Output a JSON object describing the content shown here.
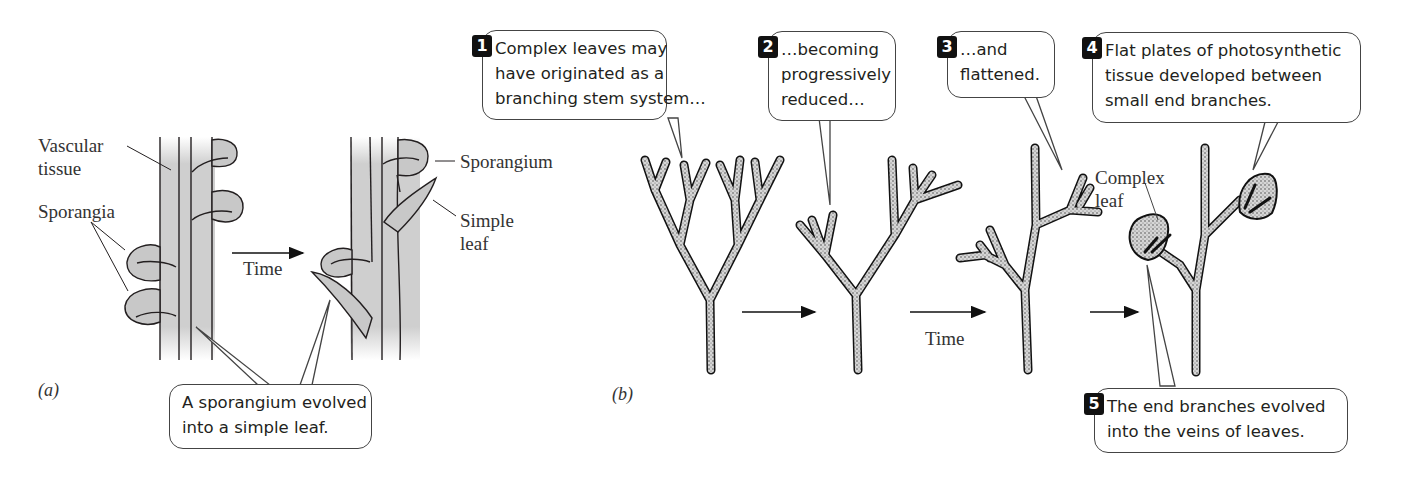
{
  "panel_a": {
    "panel_label": "(a)",
    "labels": {
      "vascular_tissue": [
        "Vascular",
        "tissue"
      ],
      "sporangia": "Sporangia",
      "time": "Time",
      "sporangium": "Sporangium",
      "simple_leaf": [
        "Simple",
        "leaf"
      ]
    },
    "callout": {
      "lines": [
        "A sporangium evolved",
        "into a simple leaf."
      ]
    }
  },
  "panel_b": {
    "panel_label": "(b)",
    "labels": {
      "time": "Time",
      "complex_leaf": [
        "Complex",
        "leaf"
      ]
    },
    "callouts": [
      {
        "number": "1",
        "lines": [
          "Complex leaves may",
          "have originated as a",
          "branching stem system…"
        ]
      },
      {
        "number": "2",
        "lines": [
          "…becoming",
          "progressively",
          "reduced…"
        ]
      },
      {
        "number": "3",
        "lines": [
          "…and",
          "flattened."
        ]
      },
      {
        "number": "4",
        "lines": [
          "Flat plates of photosynthetic",
          "tissue developed between",
          "small end branches."
        ]
      },
      {
        "number": "5",
        "lines": [
          "The end branches evolved",
          "into the veins of leaves."
        ]
      }
    ]
  },
  "colors": {
    "tissue_fill": "#c8c8c8",
    "outline": "#231f20",
    "callout_border": "#444444",
    "number_badge": "#111111"
  }
}
